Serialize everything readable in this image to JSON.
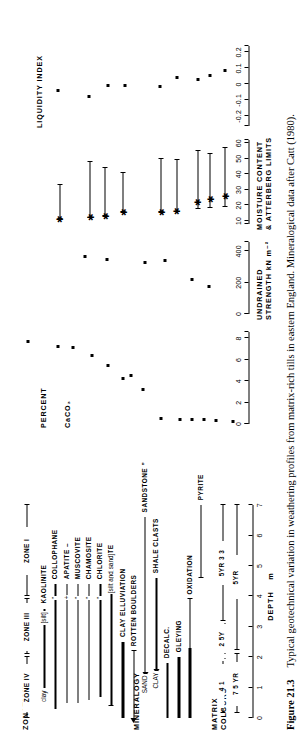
{
  "figure": {
    "number": "Figure 21.3",
    "caption": "Typical geotechnical variation in weathering profiles from matrix-rich tills in eastern England. Mineralogical data after Catt (1980)."
  },
  "depth_axis": {
    "title": "DEPTH",
    "unit": "m",
    "ticks": [
      "0",
      "1",
      "2",
      "3",
      "4",
      "5",
      "6",
      "7"
    ],
    "min": 0,
    "max": 7
  },
  "sections": {
    "matrix_colours": {
      "label_line1": "MATRIX",
      "label_line2": "COLOURS"
    },
    "mineralogy": {
      "label": "MINERALOGY"
    },
    "zonation": {
      "label": "ZONATION"
    }
  },
  "matrix_colours": {
    "rows": [
      {
        "name": "row-upper",
        "items": [
          {
            "text": "7 5 YR",
            "from": 0.15,
            "to": 2.1
          },
          {
            "text": "5YR",
            "from": 2.25,
            "to": 7.0
          }
        ]
      },
      {
        "name": "row-lower",
        "items": [
          {
            "text": "4 1",
            "from": 0.15,
            "to": 1.95
          },
          {
            "text": "2 5Y",
            "from": 2.1,
            "to": 3.1
          },
          {
            "text": "5YR 3 3",
            "from": 3.2,
            "to": 7.0
          }
        ]
      }
    ]
  },
  "mineralogy": {
    "rows": [
      {
        "label": "PYRITE",
        "style": "plain-bar",
        "from": 4.6,
        "to": 7.0
      },
      {
        "label": "OXIDATION",
        "style": "thick-left",
        "from": 0.0,
        "to": 3.9,
        "thick_to": 2.3
      },
      {
        "label": "GLEYING",
        "style": "thick-bar",
        "from": 0.0,
        "to": 2.0
      },
      {
        "label": "DECALC.",
        "style": "thick-bar",
        "from": 0.0,
        "to": 1.8
      },
      {
        "label": "SHALE CLASTS",
        "label_right": "CLAY",
        "style": "arrow-left",
        "from": 1.6,
        "to": 4.6
      },
      {
        "label": "SANDSTONE ”",
        "label_right": "SAND",
        "style": "arrow-left",
        "from": 1.5,
        "to": 6.6
      },
      {
        "label": "ROTTEN BOULDERS",
        "style": "arrow-left-long",
        "from": 0.0,
        "to": 2.2
      },
      {
        "label": "CLAY  ELLUVIATION",
        "style": "thick-bar",
        "from": 0.0,
        "to": 2.5
      },
      {
        "label": "BIOTITE",
        "note": "[silt and sand]",
        "style": "line-cap",
        "from": 0.4,
        "to": 4.6
      },
      {
        "label": "CHLORITE",
        "note": "”",
        "style": "line",
        "from": 0.7,
        "to": 4.4
      },
      {
        "label": "CHAMOSITE",
        "note": "”",
        "style": "line",
        "from": 0.6,
        "to": 4.4
      },
      {
        "label": "MUSCOVITE",
        "note": "”",
        "style": "line",
        "from": 0.5,
        "to": 4.4
      },
      {
        "label": "APATITE –",
        "note": "+",
        "style": "line",
        "from": 0.5,
        "to": 4.4
      },
      {
        "label": "COLLOPHANE",
        "note": "”",
        "style": "line",
        "from": 0.3,
        "to": 4.4
      },
      {
        "label": "KAOLINITE",
        "note": "[silt]",
        "label_right": "clay",
        "style": "line",
        "from": 1.0,
        "to": 3.6
      }
    ]
  },
  "zonation": {
    "zones": [
      {
        "label": "ZONE I",
        "from": 4.0,
        "to": 7.0
      },
      {
        "label": "ZONE III",
        "from": 2.1,
        "to": 3.9
      },
      {
        "label": "ZONE IV",
        "from": 0.0,
        "to": 2.0
      }
    ]
  },
  "chart_data": [
    {
      "type": "scatter",
      "title": "PERCENT  CaCO3",
      "xlabel": "PERCENT CaCO₃",
      "ylabel": "DEPTH m",
      "xticks": [
        "0",
        "2",
        "4",
        "6",
        "8"
      ],
      "xlim": [
        0,
        8.6
      ],
      "ylim": [
        0,
        7
      ],
      "grid": false,
      "points": [
        {
          "depth": 0.2,
          "value": 0.1
        },
        {
          "depth": 0.75,
          "value": 0.2
        },
        {
          "depth": 1.15,
          "value": 0.25
        },
        {
          "depth": 1.55,
          "value": 0.28
        },
        {
          "depth": 1.95,
          "value": 0.3
        },
        {
          "depth": 2.55,
          "value": 0.35
        },
        {
          "depth": 3.15,
          "value": 3.05
        },
        {
          "depth": 3.55,
          "value": 4.4
        },
        {
          "depth": 3.8,
          "value": 4.1
        },
        {
          "depth": 4.3,
          "value": 5.35
        },
        {
          "depth": 4.85,
          "value": 6.3
        },
        {
          "depth": 5.45,
          "value": 7.0
        },
        {
          "depth": 5.95,
          "value": 7.15
        },
        {
          "depth": 6.95,
          "value": 7.6
        }
      ]
    },
    {
      "type": "scatter",
      "title": "UNDRAINED STRENGTH kN m-2",
      "xlabel": "UNDRAINED STRENGTH  kN m⁻²",
      "ylabel": "DEPTH m",
      "xticks": [
        "0",
        "200",
        "400"
      ],
      "xlim": [
        0,
        460
      ],
      "ylim": [
        0,
        7
      ],
      "grid": false,
      "points": [
        {
          "depth": 1.0,
          "value": 168
        },
        {
          "depth": 1.55,
          "value": 212
        },
        {
          "depth": 2.45,
          "value": 330
        },
        {
          "depth": 3.1,
          "value": 318
        },
        {
          "depth": 4.35,
          "value": 337
        },
        {
          "depth": 5.05,
          "value": 360
        }
      ]
    },
    {
      "type": "range",
      "title": "MOISTURE CONTENT & ATTERBERG LIMITS",
      "xlabel": "MOISTURE  CONTENT & ATTERBERG LIMITS",
      "ylabel": "DEPTH m",
      "xticks": [
        "10",
        "20",
        "30",
        "40",
        "50",
        "60"
      ],
      "xlim": [
        8,
        62
      ],
      "ylim": [
        0,
        7
      ],
      "grid": false,
      "series": [
        {
          "name": "plastic-limit",
          "marker": "tick-low"
        },
        {
          "name": "moisture-content",
          "marker": "star"
        },
        {
          "name": "liquid-limit",
          "marker": "tick-high"
        }
      ],
      "profiles": [
        {
          "depth": 0.45,
          "low": 19.0,
          "star": 25.5,
          "high": 57.0
        },
        {
          "depth": 0.95,
          "low": 18.0,
          "star": 24.0,
          "high": 53.0
        },
        {
          "depth": 1.35,
          "low": 17.5,
          "star": 22.0,
          "high": 55.0
        },
        {
          "depth": 2.05,
          "low": 16.0,
          "star": 16.0,
          "high": 49.0
        },
        {
          "depth": 2.55,
          "low": 15.5,
          "star": 15.5,
          "high": 49.5
        },
        {
          "depth": 3.8,
          "low": 15.5,
          "star": 15.5,
          "high": 41.0
        },
        {
          "depth": 4.4,
          "low": 13.0,
          "star": 13.0,
          "high": 44.0
        },
        {
          "depth": 4.9,
          "low": 12.0,
          "star": 12.0,
          "high": 48.0
        },
        {
          "depth": 5.9,
          "low": 11.0,
          "star": 11.0,
          "high": 33.0
        }
      ]
    },
    {
      "type": "scatter",
      "title": "LIQUIDITY INDEX",
      "xlabel": "LIQUIDITY  INDEX",
      "ylabel": "DEPTH m",
      "xticks": [
        "-0.2",
        "-0.1",
        "0",
        "0.1",
        "0.2"
      ],
      "xlim": [
        -0.26,
        0.24
      ],
      "ylim": [
        0,
        7
      ],
      "grid": false,
      "points": [
        {
          "depth": 0.45,
          "value": 0.075
        },
        {
          "depth": 0.95,
          "value": 0.045
        },
        {
          "depth": 1.35,
          "value": 0.02
        },
        {
          "depth": 2.05,
          "value": 0.035
        },
        {
          "depth": 2.6,
          "value": -0.02
        },
        {
          "depth": 3.75,
          "value": -0.015
        },
        {
          "depth": 4.3,
          "value": -0.015
        },
        {
          "depth": 4.95,
          "value": -0.085
        },
        {
          "depth": 5.95,
          "value": -0.045
        }
      ]
    }
  ]
}
